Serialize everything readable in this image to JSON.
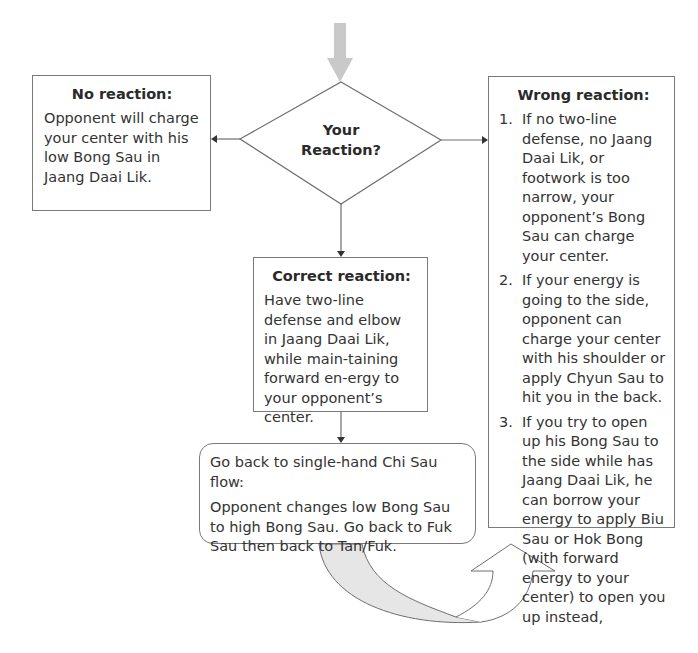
{
  "diagram": {
    "decision": {
      "line1": "Your",
      "line2": "Reaction?"
    },
    "no_reaction": {
      "title": "No reaction:",
      "text": "Opponent will charge your center with his low Bong Sau in Jaang Daai Lik."
    },
    "correct_reaction": {
      "title": "Correct reaction:",
      "text": "Have two-line defense and elbow in Jaang Daai Lik, while main-taining forward en-ergy to your opponent’s center."
    },
    "wrong_reaction": {
      "title": "Wrong reaction:",
      "items": [
        {
          "num": "1.",
          "text": "If no two-line defense, no Jaang Daai Lik, or footwork is too narrow, your opponent’s Bong Sau can charge your center."
        },
        {
          "num": "2.",
          "text": "If your energy is going to the side, opponent can charge your center with his shoulder or apply Chyun Sau to hit you in the back."
        },
        {
          "num": "3.",
          "text": "If you try to open up his Bong Sau to the side while has Jaang Daai Lik, he can borrow your energy to apply Biu Sau or Hok Bong (with forward energy to your center) to open you up instead,"
        }
      ]
    },
    "flow_back": {
      "heading": "Go back to single-hand Chi Sau flow:",
      "text": "Opponent changes low Bong Sau to high Bong Sau. Go back to Fuk Sau then back to Tan/Fuk."
    },
    "colors": {
      "line": "#6e6e6e",
      "entry_arrow": "#c9c9c9",
      "curved_arrow_fill": "#e6e6e6"
    }
  }
}
